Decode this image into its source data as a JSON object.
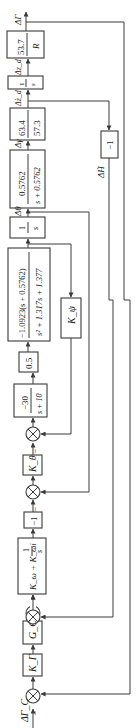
{
  "diagram": {
    "type": "control-block-diagram",
    "orientation": "rotated-90-ccw",
    "input_label": "ΔΓ_C",
    "output_label": "ΔΓ",
    "blocks": [
      {
        "id": "KG",
        "label": "K_Γ"
      },
      {
        "id": "GC",
        "label": "G_C"
      },
      {
        "id": "PI",
        "label_num": "K_ω + K_ωi",
        "label_frac_num": "1",
        "label_frac_den": "s"
      },
      {
        "id": "neg1a",
        "label": "−1"
      },
      {
        "id": "Ktheta",
        "label": "K_θ"
      },
      {
        "id": "actuator",
        "num": "−30",
        "den": "s + 10"
      },
      {
        "id": "gain05",
        "label": "0.5"
      },
      {
        "id": "plant",
        "num": "−1.0923(s + 0.5762)",
        "den": "s² + 1.317s + 1.377"
      },
      {
        "id": "int1",
        "num": "1",
        "den": "s"
      },
      {
        "id": "Kpsi",
        "label": "K_ψ"
      },
      {
        "id": "path",
        "num": "0.5762",
        "den": "s + 0.5762"
      },
      {
        "id": "scale",
        "num": "63.4",
        "den": "57.3"
      },
      {
        "id": "int2",
        "num": "1",
        "den": "s"
      },
      {
        "id": "range",
        "num": "53.7",
        "den": "R"
      },
      {
        "id": "neg1b",
        "label": "−1"
      }
    ],
    "signals": {
      "theta": "Δθ",
      "gamma": "Δγ",
      "zdot": "Δż_d",
      "z": "Δz_d",
      "hdot": "ΔḢ"
    },
    "summing_junction_sign": "−"
  }
}
